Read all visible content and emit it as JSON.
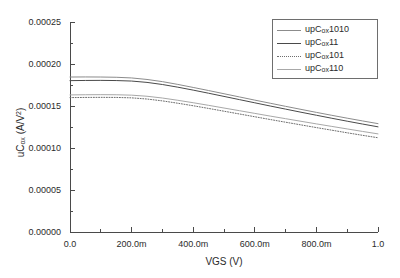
{
  "chart_data": {
    "type": "line",
    "title": "",
    "xlabel": "VGS (V)",
    "ylabel": "uCox (A/V2)",
    "ylabel_parts": {
      "prefix": "uC",
      "sub": "ox",
      "mid": " (A/V",
      "sup": "2",
      "suffix": ")"
    },
    "xlim": [
      0.0,
      1.0
    ],
    "ylim": [
      0.0,
      0.00025
    ],
    "grid": false,
    "legend_position": "top-right",
    "xticks": [
      0.0,
      0.2,
      0.4,
      0.6,
      0.8,
      1.0
    ],
    "xticklabels": [
      "0.0",
      "200.0m",
      "400.0m",
      "600.0m",
      "800.0m",
      "1.0"
    ],
    "yticks": [
      0.0,
      5e-05,
      0.0001,
      0.00015,
      0.0002,
      0.00025
    ],
    "yticklabels": [
      "0.00000",
      "0.00005",
      "0.00010",
      "0.00015",
      "0.00020",
      "0.00025"
    ],
    "x": [
      0.0,
      0.05,
      0.1,
      0.15,
      0.2,
      0.25,
      0.3,
      0.35,
      0.4,
      0.45,
      0.5,
      0.55,
      0.6,
      0.65,
      0.7,
      0.75,
      0.8,
      0.85,
      0.9,
      0.95,
      1.0
    ],
    "series": [
      {
        "name": "upCox1010",
        "label_prefix": "upC",
        "label_sub": "ox",
        "label_suffix": "1010",
        "style": "solid",
        "color": "#8c8c8c",
        "width": 1.0,
        "values": [
          0.0001845,
          0.0001846,
          0.0001845,
          0.0001842,
          0.0001834,
          0.0001816,
          0.000179,
          0.0001757,
          0.0001721,
          0.0001684,
          0.0001646,
          0.0001608,
          0.000157,
          0.0001533,
          0.0001496,
          0.000146,
          0.0001424,
          0.0001389,
          0.0001355,
          0.0001322,
          0.000129
        ]
      },
      {
        "name": "upCox11",
        "label_prefix": "upC",
        "label_sub": "ox",
        "label_suffix": "11",
        "style": "solid",
        "color": "#4a4a4a",
        "width": 1.0,
        "values": [
          0.0001802,
          0.0001804,
          0.0001805,
          0.0001803,
          0.0001797,
          0.0001781,
          0.0001756,
          0.0001724,
          0.0001689,
          0.0001652,
          0.0001614,
          0.0001576,
          0.0001538,
          0.00015,
          0.0001463,
          0.0001426,
          0.000139,
          0.0001354,
          0.0001319,
          0.0001285,
          0.0001252
        ]
      },
      {
        "name": "upCox101",
        "label_prefix": "upC",
        "label_sub": "ox",
        "label_suffix": "101",
        "style": "dotted",
        "color": "#6e6e6e",
        "width": 1.0,
        "values": [
          0.00016,
          0.0001602,
          0.0001603,
          0.0001602,
          0.0001597,
          0.0001583,
          0.0001561,
          0.0001533,
          0.0001503,
          0.0001471,
          0.0001438,
          0.0001405,
          0.0001372,
          0.0001339,
          0.0001307,
          0.0001275,
          0.0001243,
          0.0001212,
          0.0001181,
          0.0001151,
          0.0001122
        ]
      },
      {
        "name": "upCox110",
        "label_prefix": "upC",
        "label_sub": "ox",
        "label_suffix": "110",
        "style": "solid",
        "color": "#a8a8a8",
        "width": 1.0,
        "values": [
          0.0001632,
          0.0001634,
          0.0001635,
          0.0001634,
          0.0001629,
          0.0001616,
          0.0001595,
          0.0001568,
          0.0001539,
          0.0001508,
          0.0001476,
          0.0001444,
          0.0001412,
          0.000138,
          0.0001349,
          0.0001318,
          0.0001287,
          0.0001257,
          0.0001227,
          0.0001197,
          0.0001168
        ]
      }
    ]
  },
  "axes": {
    "xlabel": "VGS (V)",
    "ylabel_prefix": "uC",
    "ylabel_sub": "ox",
    "ylabel_mid": " (A/V",
    "ylabel_sup": "2",
    "ylabel_suffix": ")"
  },
  "legend": {
    "items": [
      {
        "prefix": "upC",
        "sub": "ox",
        "suffix": "1010"
      },
      {
        "prefix": "upC",
        "sub": "ox",
        "suffix": "11"
      },
      {
        "prefix": "upC",
        "sub": "ox",
        "suffix": "101"
      },
      {
        "prefix": "upC",
        "sub": "ox",
        "suffix": "110"
      }
    ]
  },
  "colors": {
    "axis": "#4a4a4a",
    "text": "#2b2b2b",
    "background": "#ffffff"
  }
}
